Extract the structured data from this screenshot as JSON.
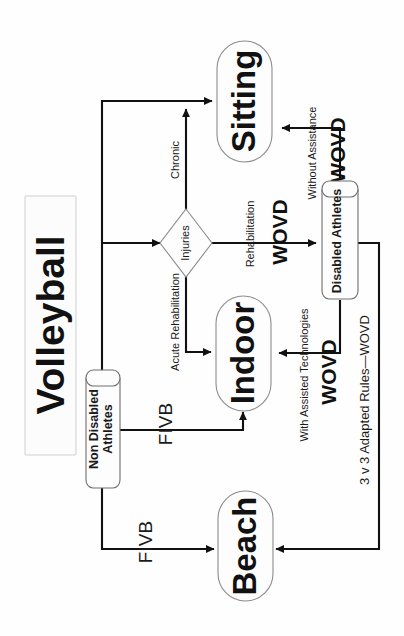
{
  "page": {
    "orientation": "rotated-90-clockwise",
    "background_color": "#ffffff",
    "width": 404,
    "height": 636
  },
  "title": {
    "text": "Volleyball",
    "box_fill": "#fcfcfc",
    "box_stroke": "#cfcfcf"
  },
  "nodes": [
    {
      "id": "non_disabled_athletes",
      "label": "Non Disabled Athletes",
      "shape": "cylinder"
    },
    {
      "id": "disabled_athletes",
      "label": "Disabled Athletes",
      "shape": "cylinder"
    },
    {
      "id": "injuries",
      "label": "Injuries",
      "shape": "diamond"
    },
    {
      "id": "sitting",
      "label": "Sitting",
      "shape": "stadium"
    },
    {
      "id": "indoor",
      "label": "Indoor",
      "shape": "stadium"
    },
    {
      "id": "beach",
      "label": "Beach",
      "shape": "stadium"
    }
  ],
  "edges": [
    {
      "id": "nda_to_injuries",
      "from": "non_disabled_athletes",
      "to": "injuries",
      "label": ""
    },
    {
      "id": "nda_to_indoor",
      "from": "non_disabled_athletes",
      "to": "indoor",
      "label": "FIVB"
    },
    {
      "id": "nda_to_beach",
      "from": "non_disabled_athletes",
      "to": "beach",
      "label": "FIVB"
    },
    {
      "id": "inj_to_sitting",
      "from": "injuries",
      "to": "sitting",
      "label": "Chronic"
    },
    {
      "id": "inj_to_indoor",
      "from": "injuries",
      "to": "indoor",
      "label": "Acute Rehabilitation"
    },
    {
      "id": "inj_to_disabled",
      "from": "injuries",
      "to": "disabled_athletes",
      "label_small": "Rehabilitation",
      "label_large": "WOVD"
    },
    {
      "id": "da_to_sitting",
      "from": "disabled_athletes",
      "to": "sitting",
      "label_small": "Without Assistance",
      "label_large": "WOVD"
    },
    {
      "id": "da_to_indoor",
      "from": "disabled_athletes",
      "to": "indoor",
      "label_small": "With Assisted Technologies",
      "label_large": "WOVD"
    },
    {
      "id": "da_to_beach",
      "from": "disabled_athletes",
      "to": "beach",
      "label": "3 v 3 Adapted Rules—WOVD"
    }
  ],
  "labels": {
    "title": "Volleyball",
    "non_disabled_line1": "Non Disabled",
    "non_disabled_line2": "Athletes",
    "disabled_athletes": "Disabled Athletes",
    "injuries": "Injuries",
    "sitting": "Sitting",
    "indoor": "Indoor",
    "beach": "Beach",
    "chronic": "Chronic",
    "acute_rehabilitation": "Acute Rehabilitation",
    "rehabilitation": "Rehabilitation",
    "wovd_rehab": "WOVD",
    "without_assistance": "Without Assistance",
    "wovd_sitting": "WOVD",
    "with_assisted_technologies": "With Assisted Technologies",
    "wovd_indoor": "WOVD",
    "fivb_indoor": "FIVB",
    "fivb_beach": "FIVB",
    "three_v_three": "3 v 3 Adapted Rules—WOVD"
  }
}
